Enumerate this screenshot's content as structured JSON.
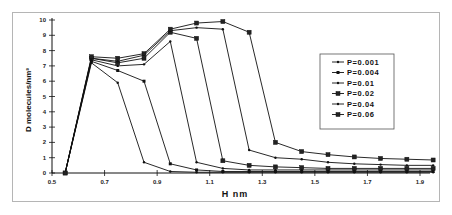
{
  "chart_data": {
    "type": "line",
    "title": "",
    "xlabel": "H  nm",
    "ylabel": "D molecules/nm³",
    "xlim": [
      0.5,
      1.95
    ],
    "ylim": [
      0,
      10
    ],
    "xticks": [
      0.5,
      0.7,
      0.9,
      1.1,
      1.3,
      1.5,
      1.7,
      1.9
    ],
    "xtick_labels": [
      "0.5",
      "0.7",
      "0.9",
      "1.1",
      "1.3",
      "1.5",
      "1.7",
      "1.9"
    ],
    "yticks": [
      0,
      1,
      2,
      3,
      4,
      5,
      6,
      7,
      8,
      9,
      10
    ],
    "ytick_labels": [
      "0",
      "1",
      "2",
      "3",
      "4",
      "5",
      "6",
      "7",
      "8",
      "9",
      "10"
    ],
    "grid": false,
    "legend_position": "right",
    "x": [
      0.55,
      0.65,
      0.75,
      0.85,
      0.95,
      1.05,
      1.15,
      1.25,
      1.35,
      1.45,
      1.55,
      1.65,
      1.75,
      1.85,
      1.95
    ],
    "series": [
      {
        "name": "P=0.001",
        "marker": "dot",
        "values": [
          0,
          7.2,
          5.9,
          0.7,
          0.1,
          0.05,
          0.05,
          0.05,
          0.05,
          0.05,
          0.05,
          0.05,
          0.05,
          0.05,
          0.05
        ]
      },
      {
        "name": "P=0.004",
        "marker": "small-square",
        "values": [
          0,
          7.3,
          6.7,
          6.0,
          0.6,
          0.2,
          0.1,
          0.1,
          0.1,
          0.1,
          0.1,
          0.1,
          0.1,
          0.1,
          0.1
        ]
      },
      {
        "name": "P=0.01",
        "marker": "dot",
        "values": [
          0,
          7.4,
          7.0,
          7.1,
          8.6,
          0.7,
          0.3,
          0.2,
          0.2,
          0.2,
          0.2,
          0.2,
          0.2,
          0.2,
          0.2
        ]
      },
      {
        "name": "P=0.02",
        "marker": "square",
        "values": [
          0,
          7.5,
          7.2,
          7.5,
          9.2,
          8.8,
          0.8,
          0.5,
          0.4,
          0.35,
          0.3,
          0.3,
          0.3,
          0.3,
          0.3
        ]
      },
      {
        "name": "P=0.04",
        "marker": "dot",
        "values": [
          0,
          7.5,
          7.3,
          7.7,
          9.3,
          9.5,
          9.4,
          1.5,
          1.0,
          0.9,
          0.7,
          0.6,
          0.55,
          0.5,
          0.5
        ]
      },
      {
        "name": "P=0.06",
        "marker": "square",
        "values": [
          0,
          7.6,
          7.5,
          7.8,
          9.4,
          9.8,
          9.9,
          9.2,
          2.0,
          1.4,
          1.2,
          1.05,
          0.95,
          0.9,
          0.85
        ]
      }
    ]
  }
}
